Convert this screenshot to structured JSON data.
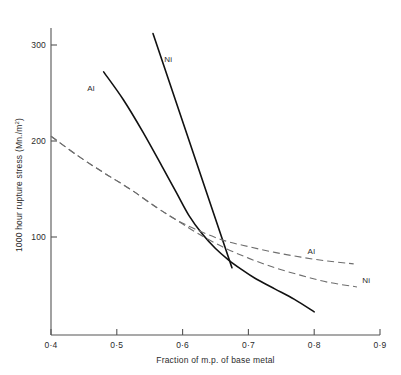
{
  "chart_data": {
    "type": "line",
    "title": "",
    "xlabel": "Fraction of m.p. of base metal",
    "ylabel": "1000 hour rupture stress (Mn./m²)",
    "ylabel_main": "1000 hour rupture stress (Mn./m",
    "ylabel_sup": "2",
    "ylabel_tail": ")",
    "xlim": [
      0.4,
      0.9
    ],
    "ylim": [
      0,
      330
    ],
    "grid": false,
    "legend": "inline-curve-labels",
    "xticks": [
      0.4,
      0.5,
      0.6,
      0.7,
      0.8,
      0.9
    ],
    "xtick_labels": [
      "0·4",
      "0·5",
      "0·6",
      "0·7",
      "0·8",
      "0·9"
    ],
    "yticks": [
      100,
      200,
      300
    ],
    "ytick_labels": [
      "100",
      "200",
      "300"
    ],
    "series": [
      {
        "name": "Al",
        "style": "solid",
        "color": "#111111",
        "label": "Al",
        "label_x": 0.455,
        "label_y": 252,
        "x": [
          0.48,
          0.51,
          0.54,
          0.57,
          0.59,
          0.61,
          0.63,
          0.65,
          0.67,
          0.69,
          0.71,
          0.74,
          0.77,
          0.8
        ],
        "y": [
          272,
          243,
          209,
          172,
          147,
          122,
          103,
          88,
          76,
          66,
          57,
          46,
          35,
          22
        ]
      },
      {
        "name": "Ni",
        "style": "solid",
        "color": "#111111",
        "label": "Ni",
        "label_x": 0.572,
        "label_y": 282,
        "x": [
          0.555,
          0.59,
          0.62,
          0.65,
          0.675
        ],
        "y": [
          312,
          243,
          182,
          121,
          68
        ]
      },
      {
        "name": "Al",
        "style": "dashed",
        "color": "#6e6e6e",
        "label": "Al",
        "label_x": 0.79,
        "label_y": 82,
        "x": [
          0.4,
          0.44,
          0.48,
          0.52,
          0.56,
          0.59,
          0.62,
          0.66,
          0.7,
          0.74,
          0.78,
          0.82,
          0.86
        ],
        "y": [
          205,
          185,
          167,
          150,
          131,
          118,
          108,
          97,
          90,
          84,
          79,
          75,
          72
        ]
      },
      {
        "name": "Ni",
        "style": "dashed",
        "color": "#6e6e6e",
        "label": "Ni",
        "label_x": 0.873,
        "label_y": 52,
        "x": [
          0.4,
          0.44,
          0.48,
          0.52,
          0.56,
          0.59,
          0.62,
          0.66,
          0.7,
          0.74,
          0.78,
          0.82,
          0.865
        ],
        "y": [
          205,
          185,
          167,
          150,
          131,
          118,
          105,
          90,
          78,
          68,
          60,
          53,
          48
        ]
      }
    ]
  },
  "axis": {
    "x_title": "Fraction of m.p. of base metal",
    "y_title": "1000 hour rupture stress (Mn./m2)"
  }
}
